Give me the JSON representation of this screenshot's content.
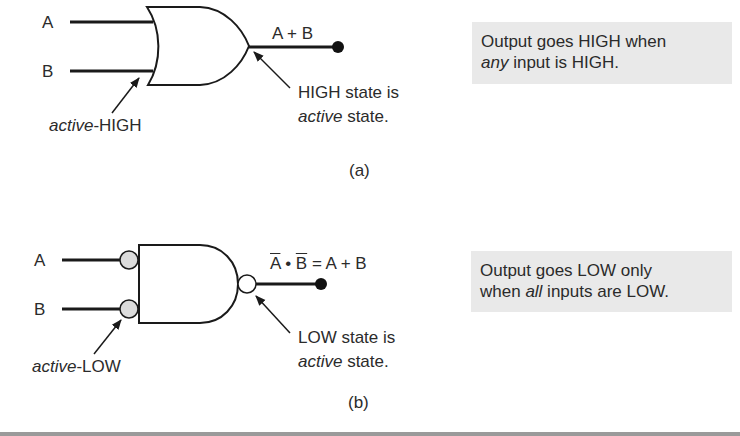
{
  "figure_a": {
    "input_a": "A",
    "input_b": "B",
    "output_expr": "A + B",
    "input_note_italic": "active",
    "input_note_rest": "-HIGH",
    "output_note_line1": "HIGH state is",
    "output_note_italic": "active",
    "output_note_rest": " state.",
    "caption": "(a)",
    "desc_line1": "Output goes HIGH when",
    "desc_italic": "any",
    "desc_line2_rest": " input is HIGH."
  },
  "figure_b": {
    "input_a": "A",
    "input_b": "B",
    "expr_a_bar": "A",
    "expr_dot": " • ",
    "expr_b_bar": "B",
    "expr_rest": " = A + B",
    "input_note_italic": "active",
    "input_note_rest": "-LOW",
    "output_note_line1": "LOW state is",
    "output_note_italic": "active",
    "output_note_rest": " state.",
    "caption": "(b)",
    "desc_line1": "Output goes LOW only",
    "desc_line2_pre": "when ",
    "desc_italic": "all",
    "desc_line2_rest": " inputs are LOW."
  },
  "colors": {
    "note_background": "#e9e9e9",
    "line": "#1a1a1a",
    "input_bubble": "#dcdcdc",
    "output_bubble": "#ffffff"
  }
}
